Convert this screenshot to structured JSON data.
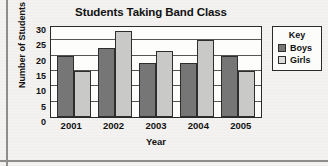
{
  "chart_data": {
    "type": "bar",
    "title": "Students Taking Band Class",
    "xlabel": "Year",
    "ylabel": "Number of Students",
    "categories": [
      "2001",
      "2002",
      "2003",
      "2004",
      "2005"
    ],
    "series": [
      {
        "name": "Boys",
        "color": "#767676",
        "values": [
          20,
          22.5,
          17.5,
          17.5,
          20
        ]
      },
      {
        "name": "Girls",
        "color": "#c9c9c7",
        "values": [
          15,
          28,
          21.5,
          25,
          15
        ]
      }
    ],
    "ylim": [
      0,
      30
    ],
    "yticks": [
      0,
      5,
      10,
      15,
      20,
      25,
      30
    ],
    "ytick_labels": [
      "0",
      "5",
      "10",
      "15",
      "20",
      "25",
      "30"
    ],
    "grid": true,
    "legend_position": "right",
    "legend_title": "Key"
  },
  "legend": {
    "title": "Key",
    "entries": [
      {
        "label": "Boys"
      },
      {
        "label": "Girls"
      }
    ]
  }
}
